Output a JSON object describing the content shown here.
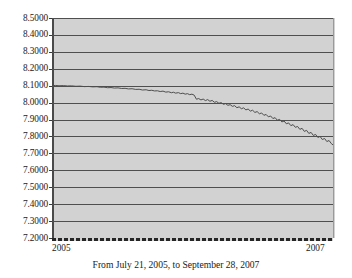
{
  "chart_data": {
    "type": "line",
    "title": "",
    "subtitle": "",
    "caption": "From July 21, 2005, to September 28, 2007",
    "xlabel": "",
    "ylabel": "",
    "grid": true,
    "legend": "none",
    "ylim": [
      7.2,
      8.5
    ],
    "ytick_labels": [
      "8.5000",
      "8.4000",
      "8.3000",
      "8.2000",
      "8.1000",
      "8.0000",
      "7.9000",
      "7.8000",
      "7.7000",
      "7.6000",
      "7.5000",
      "7.4000",
      "7.3000",
      "7.2000"
    ],
    "ytick_values": [
      8.5,
      8.4,
      8.3,
      8.2,
      8.1,
      8.0,
      7.9,
      7.8,
      7.7,
      7.6,
      7.5,
      7.4,
      7.3,
      7.2
    ],
    "xtick_labels": [
      "2005",
      "2007"
    ],
    "x_start": "July 21, 2005",
    "x_end": "September 28, 2007",
    "series": [
      {
        "name": "series-1",
        "color": "#4d4d4d",
        "x": [
          0,
          0.008,
          0.016,
          0.024,
          0.032,
          0.04,
          0.048,
          0.056,
          0.064,
          0.072,
          0.08,
          0.088,
          0.096,
          0.104,
          0.112,
          0.12,
          0.128,
          0.136,
          0.144,
          0.152,
          0.16,
          0.168,
          0.176,
          0.184,
          0.192,
          0.2,
          0.208,
          0.216,
          0.224,
          0.232,
          0.24,
          0.248,
          0.256,
          0.264,
          0.272,
          0.28,
          0.288,
          0.296,
          0.304,
          0.312,
          0.32,
          0.328,
          0.336,
          0.344,
          0.352,
          0.36,
          0.368,
          0.376,
          0.384,
          0.392,
          0.4,
          0.408,
          0.416,
          0.424,
          0.432,
          0.44,
          0.448,
          0.456,
          0.464,
          0.472,
          0.48,
          0.488,
          0.496,
          0.504,
          0.512,
          0.52,
          0.528,
          0.536,
          0.544,
          0.552,
          0.56,
          0.568,
          0.576,
          0.584,
          0.592,
          0.6,
          0.608,
          0.616,
          0.624,
          0.632,
          0.64,
          0.648,
          0.656,
          0.664,
          0.672,
          0.68,
          0.688,
          0.696,
          0.704,
          0.712,
          0.72,
          0.728,
          0.736,
          0.744,
          0.752,
          0.76,
          0.768,
          0.776,
          0.784,
          0.792,
          0.8,
          0.808,
          0.816,
          0.824,
          0.832,
          0.84,
          0.848,
          0.856,
          0.864,
          0.872,
          0.88,
          0.888,
          0.896,
          0.904,
          0.912,
          0.92,
          0.928,
          0.936,
          0.944,
          0.952,
          0.96,
          0.968,
          0.976,
          0.984,
          0.992,
          1.0
        ],
        "y": [
          8.1,
          8.101,
          8.1005,
          8.0995,
          8.1,
          8.099,
          8.0985,
          8.098,
          8.0975,
          8.0985,
          8.097,
          8.096,
          8.0965,
          8.095,
          8.0945,
          8.0955,
          8.094,
          8.093,
          8.0925,
          8.0935,
          8.0915,
          8.0905,
          8.091,
          8.0895,
          8.088,
          8.089,
          8.087,
          8.0855,
          8.086,
          8.0845,
          8.083,
          8.084,
          8.082,
          8.0805,
          8.081,
          8.079,
          8.0775,
          8.078,
          8.076,
          8.0745,
          8.075,
          8.073,
          8.0715,
          8.07,
          8.069,
          8.07,
          8.0675,
          8.0655,
          8.064,
          8.065,
          8.0625,
          8.06,
          8.0585,
          8.0595,
          8.056,
          8.0535,
          8.052,
          8.054,
          8.05,
          8.047,
          8.045,
          8.0465,
          8.043,
          8.04,
          8.038,
          8.0395,
          8.035,
          8.032,
          8.03,
          8.033,
          8.028,
          8.025,
          8.023,
          8.026,
          8.02,
          8.017,
          8.019,
          8.014,
          8.01,
          8.013,
          8.006,
          8.002,
          7.999,
          8.003,
          7.995,
          7.99,
          7.987,
          7.991,
          7.984,
          7.979,
          7.976,
          7.98,
          7.972,
          7.966,
          7.963,
          7.968,
          7.959,
          7.953,
          7.949,
          7.954,
          7.944,
          7.938,
          7.934,
          7.939,
          7.928,
          7.921,
          7.916,
          7.922,
          7.91,
          7.903,
          7.898,
          7.904,
          7.89,
          7.882,
          7.876,
          7.883,
          7.868,
          7.859,
          7.852,
          7.86,
          7.843,
          7.833,
          7.825,
          7.834,
          7.815,
          7.804
        ]
      }
    ],
    "path_points": [
      [
        0.0,
        8.1
      ],
      [
        0.012,
        8.1015
      ],
      [
        0.025,
        8.0995
      ],
      [
        0.04,
        8.1005
      ],
      [
        0.055,
        8.0985
      ],
      [
        0.07,
        8.099
      ],
      [
        0.085,
        8.0965
      ],
      [
        0.1,
        8.0975
      ],
      [
        0.115,
        8.0945
      ],
      [
        0.13,
        8.0955
      ],
      [
        0.145,
        8.093
      ],
      [
        0.16,
        8.094
      ],
      [
        0.172,
        8.0905
      ],
      [
        0.185,
        8.0915
      ],
      [
        0.198,
        8.088
      ],
      [
        0.21,
        8.089
      ],
      [
        0.222,
        8.086
      ],
      [
        0.235,
        8.087
      ],
      [
        0.248,
        8.0835
      ],
      [
        0.26,
        8.0845
      ],
      [
        0.272,
        8.081
      ],
      [
        0.285,
        8.082
      ],
      [
        0.298,
        8.078
      ],
      [
        0.31,
        8.079
      ],
      [
        0.322,
        8.0745
      ],
      [
        0.335,
        8.076
      ],
      [
        0.345,
        8.0715
      ],
      [
        0.355,
        8.073
      ],
      [
        0.365,
        8.069
      ],
      [
        0.375,
        8.07
      ],
      [
        0.385,
        8.0655
      ],
      [
        0.395,
        8.068
      ],
      [
        0.405,
        8.062
      ],
      [
        0.415,
        8.064
      ],
      [
        0.425,
        8.0585
      ],
      [
        0.432,
        8.0615
      ],
      [
        0.44,
        8.056
      ],
      [
        0.45,
        8.059
      ],
      [
        0.458,
        8.053
      ],
      [
        0.466,
        8.056
      ],
      [
        0.474,
        8.05
      ],
      [
        0.482,
        8.053
      ],
      [
        0.49,
        8.047
      ],
      [
        0.498,
        8.05
      ],
      [
        0.506,
        8.044
      ],
      [
        0.514,
        8.02
      ],
      [
        0.522,
        8.024
      ],
      [
        0.53,
        8.016
      ],
      [
        0.538,
        8.021
      ],
      [
        0.546,
        8.012
      ],
      [
        0.554,
        8.018
      ],
      [
        0.562,
        8.008
      ],
      [
        0.57,
        8.013
      ],
      [
        0.578,
        8.002
      ],
      [
        0.586,
        8.006
      ],
      [
        0.594,
        7.996
      ],
      [
        0.602,
        8.0
      ],
      [
        0.61,
        7.99
      ],
      [
        0.618,
        7.994
      ],
      [
        0.626,
        7.984
      ],
      [
        0.634,
        7.988
      ],
      [
        0.642,
        7.978
      ],
      [
        0.65,
        7.982
      ],
      [
        0.658,
        7.97
      ],
      [
        0.666,
        7.975
      ],
      [
        0.674,
        7.964
      ],
      [
        0.682,
        7.969
      ],
      [
        0.69,
        7.957
      ],
      [
        0.698,
        7.962
      ],
      [
        0.706,
        7.95
      ],
      [
        0.714,
        7.955
      ],
      [
        0.722,
        7.942
      ],
      [
        0.73,
        7.947
      ],
      [
        0.738,
        7.934
      ],
      [
        0.746,
        7.939
      ],
      [
        0.754,
        7.925
      ],
      [
        0.762,
        7.93
      ],
      [
        0.77,
        7.916
      ],
      [
        0.778,
        7.921
      ],
      [
        0.786,
        7.906
      ],
      [
        0.794,
        7.911
      ],
      [
        0.802,
        7.896
      ],
      [
        0.81,
        7.901
      ],
      [
        0.818,
        7.886
      ],
      [
        0.826,
        7.891
      ],
      [
        0.834,
        7.875
      ],
      [
        0.842,
        7.88
      ],
      [
        0.85,
        7.864
      ],
      [
        0.858,
        7.87
      ],
      [
        0.866,
        7.854
      ],
      [
        0.874,
        7.859
      ],
      [
        0.882,
        7.842
      ],
      [
        0.89,
        7.848
      ],
      [
        0.898,
        7.83
      ],
      [
        0.906,
        7.836
      ],
      [
        0.914,
        7.818
      ],
      [
        0.922,
        7.824
      ],
      [
        0.93,
        7.806
      ],
      [
        0.938,
        7.812
      ],
      [
        0.946,
        7.794
      ],
      [
        0.954,
        7.8
      ],
      [
        0.962,
        7.782
      ],
      [
        0.97,
        7.788
      ],
      [
        0.978,
        7.77
      ],
      [
        0.986,
        7.776
      ],
      [
        0.994,
        7.758
      ],
      [
        1.0,
        7.75
      ]
    ]
  },
  "axis": {
    "ytick_labels": [
      "8.5000",
      "8.4000",
      "8.3000",
      "8.2000",
      "8.1000",
      "8.0000",
      "7.9000",
      "7.8000",
      "7.7000",
      "7.6000",
      "7.5000",
      "7.4000",
      "7.3000",
      "7.2000"
    ],
    "xtick_start": "2005",
    "xtick_end": "2007"
  },
  "caption_text": "From July 21, 2005, to September 28, 2007",
  "colors": {
    "plot_background": "#d2d2d2",
    "gridline": "#4f4f4f",
    "series_line": "#4d4d4d",
    "axis": "#262626",
    "text": "#1a1a1a",
    "page_background": "#ffffff"
  }
}
